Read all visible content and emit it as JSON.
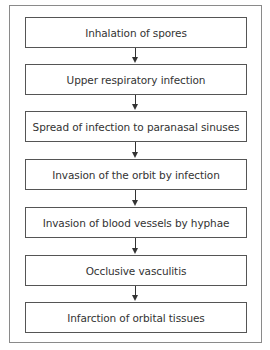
{
  "diagram": {
    "type": "flowchart",
    "direction": "top-to-bottom",
    "steps": [
      {
        "label": "Inhalation of spores"
      },
      {
        "label": "Upper respiratory infection"
      },
      {
        "label": "Spread of infection to paranasal sinuses"
      },
      {
        "label": "Invasion of the orbit by infection"
      },
      {
        "label": "Invasion of blood vessels by hyphae"
      },
      {
        "label": "Occlusive vasculitis"
      },
      {
        "label": "Infarction of orbital tissues"
      }
    ],
    "colors": {
      "border": "#555555",
      "frame": "#8a8a8a",
      "text": "#333333"
    }
  }
}
